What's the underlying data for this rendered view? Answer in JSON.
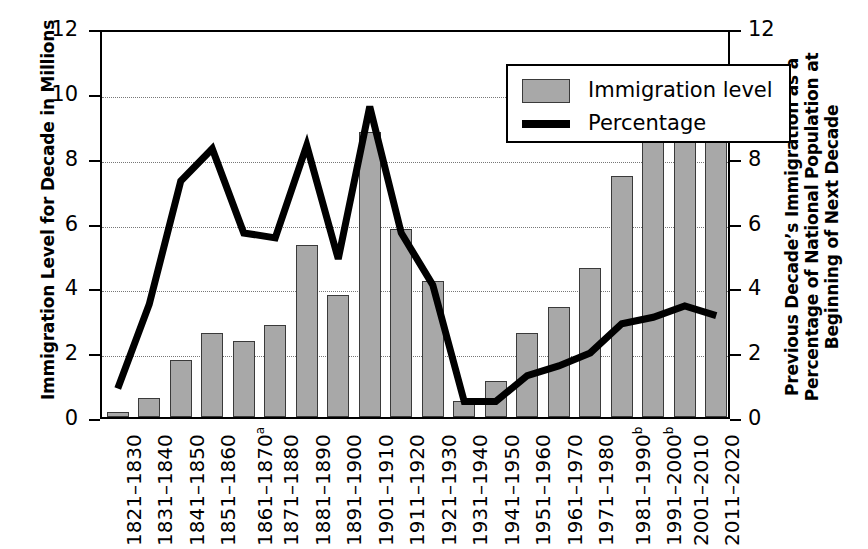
{
  "axes": {
    "left_title": "Immigration Level for Decade in Millions",
    "right_title": "Previous Decade’s Immigration as a Percentage of National Population at Beginning of Next Decade",
    "left_ticks": [
      "0",
      "2",
      "4",
      "6",
      "8",
      "10",
      "12"
    ],
    "right_ticks": [
      "0",
      "2",
      "4",
      "6",
      "8",
      "10",
      "12"
    ]
  },
  "legend": {
    "bar_label": "Immigration level",
    "line_label": "Percentage",
    "bar_color": "#a8a8a8",
    "line_color": "#000000"
  },
  "chart_data": {
    "type": "bar",
    "title": "",
    "xlabel": "",
    "ylabel": "Immigration Level for Decade in Millions",
    "y2label": "Previous Decade’s Immigration as a Percentage of National Population at Beginning of Next Decade",
    "ylim": [
      0,
      12
    ],
    "y2lim": [
      0,
      12
    ],
    "grid": true,
    "legend_position": "top-right-inside",
    "categories": [
      "1821–1830",
      "1831–1840",
      "1841–1850",
      "1851–1860",
      "1861–1870",
      "1871–1880",
      "1881–1890",
      "1891–1900",
      "1901–1910",
      "1911–1920",
      "1921–1930",
      "1931–1940",
      "1941–1950",
      "1951–1960",
      "1961–1970",
      "1971–1980",
      "1981–1990",
      "1991–2000",
      "2001–2010",
      "2011–2020"
    ],
    "category_footnotes": [
      "",
      "",
      "",
      "",
      "a",
      "",
      "",
      "",
      "",
      "",
      "",
      "",
      "",
      "",
      "",
      "",
      "b",
      "b",
      "",
      ""
    ],
    "series": [
      {
        "name": "Immigration level",
        "type": "bar",
        "axis": "left",
        "unit": "millions",
        "values": [
          0.15,
          0.6,
          1.75,
          2.6,
          2.35,
          2.85,
          5.3,
          3.75,
          8.8,
          5.8,
          4.2,
          0.5,
          1.1,
          2.6,
          3.4,
          4.6,
          7.45,
          9.15,
          10.6,
          10.45
        ]
      },
      {
        "name": "Percentage",
        "type": "line",
        "axis": "right",
        "unit": "percent",
        "values": [
          1.0,
          3.6,
          7.4,
          8.4,
          5.8,
          5.65,
          8.5,
          5.0,
          9.7,
          5.8,
          4.2,
          0.6,
          0.6,
          1.4,
          1.7,
          2.1,
          3.0,
          3.2,
          3.55,
          3.25
        ]
      }
    ]
  }
}
